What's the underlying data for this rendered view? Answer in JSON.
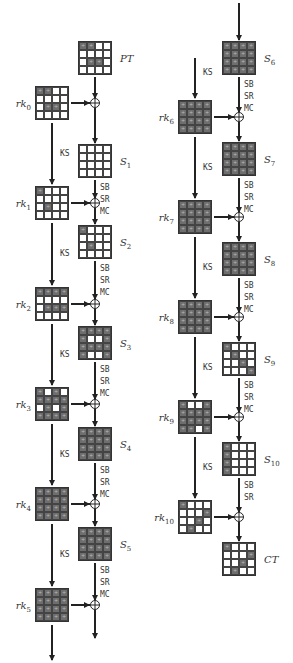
{
  "shade_color": "#6e6e6e",
  "operations": {
    "key_schedule": "KS",
    "sub_bytes": "SB",
    "shift_rows": "SR",
    "mix_columns": "MC"
  },
  "left_column": {
    "states": [
      {
        "id": "PT",
        "label": "PT",
        "sub": "",
        "pattern": [
          [
            1,
            1,
            0,
            0
          ],
          [
            0,
            0,
            0,
            0
          ],
          [
            0,
            1,
            1,
            0
          ],
          [
            0,
            0,
            0,
            0
          ]
        ]
      },
      {
        "id": "S1",
        "label": "S",
        "sub": "1",
        "pattern": [
          [
            0,
            0,
            0,
            0
          ],
          [
            0,
            0,
            0,
            0
          ],
          [
            0,
            0,
            0,
            0
          ],
          [
            0,
            0,
            0,
            0
          ]
        ]
      },
      {
        "id": "S2",
        "label": "S",
        "sub": "2",
        "pattern": [
          [
            1,
            0,
            0,
            0
          ],
          [
            0,
            0,
            0,
            0
          ],
          [
            0,
            1,
            0,
            0
          ],
          [
            0,
            0,
            0,
            0
          ]
        ]
      },
      {
        "id": "S3",
        "label": "S",
        "sub": "3",
        "pattern": [
          [
            1,
            1,
            1,
            1
          ],
          [
            1,
            0,
            0,
            1
          ],
          [
            1,
            1,
            1,
            1
          ],
          [
            1,
            0,
            0,
            1
          ]
        ]
      },
      {
        "id": "S4",
        "label": "S",
        "sub": "4",
        "pattern": [
          [
            1,
            1,
            1,
            1
          ],
          [
            1,
            1,
            1,
            1
          ],
          [
            1,
            1,
            1,
            1
          ],
          [
            1,
            1,
            1,
            1
          ]
        ]
      },
      {
        "id": "S5",
        "label": "S",
        "sub": "5",
        "pattern": [
          [
            1,
            1,
            1,
            1
          ],
          [
            1,
            1,
            1,
            1
          ],
          [
            1,
            1,
            1,
            1
          ],
          [
            1,
            1,
            1,
            1
          ]
        ]
      }
    ],
    "keys": [
      {
        "id": "rk0",
        "label": "rk",
        "sub": "0",
        "pattern": [
          [
            1,
            1,
            0,
            0
          ],
          [
            0,
            0,
            0,
            0
          ],
          [
            0,
            1,
            1,
            0
          ],
          [
            0,
            0,
            0,
            0
          ]
        ]
      },
      {
        "id": "rk1",
        "label": "rk",
        "sub": "1",
        "pattern": [
          [
            1,
            0,
            0,
            0
          ],
          [
            0,
            0,
            0,
            0
          ],
          [
            0,
            1,
            0,
            0
          ],
          [
            0,
            0,
            0,
            0
          ]
        ]
      },
      {
        "id": "rk2",
        "label": "rk",
        "sub": "2",
        "pattern": [
          [
            1,
            1,
            1,
            1
          ],
          [
            0,
            0,
            0,
            0
          ],
          [
            0,
            1,
            1,
            1
          ],
          [
            0,
            0,
            0,
            0
          ]
        ]
      },
      {
        "id": "rk3",
        "label": "rk",
        "sub": "3",
        "pattern": [
          [
            1,
            0,
            1,
            0
          ],
          [
            1,
            1,
            1,
            1
          ],
          [
            0,
            1,
            0,
            1
          ],
          [
            1,
            1,
            1,
            1
          ]
        ]
      },
      {
        "id": "rk4",
        "label": "rk",
        "sub": "4",
        "pattern": [
          [
            1,
            1,
            1,
            1
          ],
          [
            1,
            1,
            1,
            1
          ],
          [
            1,
            1,
            1,
            1
          ],
          [
            1,
            1,
            1,
            1
          ]
        ]
      },
      {
        "id": "rk5",
        "label": "rk",
        "sub": "5",
        "pattern": [
          [
            1,
            1,
            1,
            1
          ],
          [
            1,
            1,
            1,
            1
          ],
          [
            1,
            1,
            1,
            1
          ],
          [
            1,
            1,
            1,
            1
          ]
        ]
      }
    ]
  },
  "right_column": {
    "states": [
      {
        "id": "S6",
        "label": "S",
        "sub": "6",
        "pattern": [
          [
            1,
            1,
            1,
            1
          ],
          [
            1,
            1,
            1,
            1
          ],
          [
            1,
            1,
            1,
            1
          ],
          [
            1,
            1,
            1,
            1
          ]
        ]
      },
      {
        "id": "S7",
        "label": "S",
        "sub": "7",
        "pattern": [
          [
            1,
            1,
            1,
            1
          ],
          [
            1,
            1,
            1,
            1
          ],
          [
            1,
            1,
            1,
            1
          ],
          [
            1,
            1,
            1,
            1
          ]
        ]
      },
      {
        "id": "S8",
        "label": "S",
        "sub": "8",
        "pattern": [
          [
            1,
            1,
            1,
            1
          ],
          [
            1,
            1,
            1,
            1
          ],
          [
            1,
            1,
            1,
            1
          ],
          [
            1,
            1,
            1,
            1
          ]
        ]
      },
      {
        "id": "S9",
        "label": "S",
        "sub": "9",
        "pattern": [
          [
            1,
            0,
            0,
            0
          ],
          [
            0,
            1,
            0,
            0
          ],
          [
            0,
            0,
            1,
            0
          ],
          [
            0,
            0,
            0,
            1
          ]
        ]
      },
      {
        "id": "S10",
        "label": "S",
        "sub": "10",
        "pattern": [
          [
            1,
            0,
            0,
            0
          ],
          [
            1,
            0,
            0,
            0
          ],
          [
            1,
            0,
            0,
            0
          ],
          [
            1,
            0,
            0,
            0
          ]
        ]
      },
      {
        "id": "CT",
        "label": "CT",
        "sub": "",
        "pattern": [
          [
            1,
            0,
            0,
            0
          ],
          [
            0,
            0,
            0,
            1
          ],
          [
            0,
            0,
            1,
            0
          ],
          [
            0,
            1,
            0,
            0
          ]
        ]
      }
    ],
    "keys": [
      {
        "id": "rk6",
        "label": "rk",
        "sub": "6",
        "pattern": [
          [
            1,
            1,
            1,
            1
          ],
          [
            1,
            1,
            1,
            1
          ],
          [
            1,
            1,
            1,
            1
          ],
          [
            1,
            1,
            1,
            1
          ]
        ]
      },
      {
        "id": "rk7",
        "label": "rk",
        "sub": "7",
        "pattern": [
          [
            1,
            1,
            1,
            1
          ],
          [
            1,
            1,
            1,
            1
          ],
          [
            1,
            1,
            1,
            1
          ],
          [
            1,
            1,
            1,
            1
          ]
        ]
      },
      {
        "id": "rk8",
        "label": "rk",
        "sub": "8",
        "pattern": [
          [
            1,
            1,
            1,
            1
          ],
          [
            1,
            1,
            1,
            1
          ],
          [
            1,
            1,
            1,
            1
          ],
          [
            1,
            1,
            1,
            1
          ]
        ]
      },
      {
        "id": "rk9",
        "label": "rk",
        "sub": "9",
        "pattern": [
          [
            1,
            0,
            0,
            1
          ],
          [
            1,
            1,
            1,
            1
          ],
          [
            1,
            1,
            1,
            1
          ],
          [
            1,
            1,
            0,
            1
          ]
        ]
      },
      {
        "id": "rk10",
        "label": "rk",
        "sub": "10",
        "pattern": [
          [
            1,
            0,
            0,
            0
          ],
          [
            0,
            0,
            0,
            1
          ],
          [
            0,
            0,
            1,
            0
          ],
          [
            0,
            1,
            0,
            0
          ]
        ]
      }
    ]
  }
}
